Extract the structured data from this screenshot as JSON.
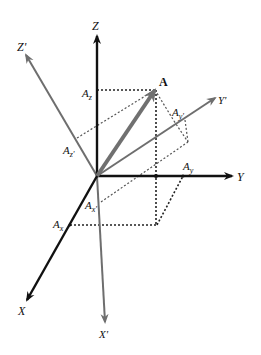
{
  "diagram": {
    "colors": {
      "original_axes": "#111111",
      "rotated_axes": "#6e6e6e",
      "vector": "#707070",
      "dotted": "#222222",
      "background": "#ffffff"
    },
    "origin": [
      97,
      176
    ],
    "axes_original": [
      {
        "name": "Z",
        "label": "Z",
        "tip": [
          97,
          36
        ]
      },
      {
        "name": "Y",
        "label": "Y",
        "tip": [
          232,
          176
        ]
      },
      {
        "name": "X",
        "label": "X",
        "tip": [
          27,
          300
        ]
      }
    ],
    "axes_rotated": [
      {
        "name": "Z'",
        "label": "Z'",
        "tip": [
          26,
          55
        ]
      },
      {
        "name": "Y'",
        "label": "Y'",
        "tip": [
          215,
          98
        ]
      },
      {
        "name": "X'",
        "label": "X'",
        "tip": [
          105,
          322
        ]
      }
    ],
    "vector": {
      "label": "A",
      "tip": [
        155,
        90
      ]
    },
    "components": {
      "Az": {
        "main": "A",
        "sub": "z"
      },
      "Ay": {
        "main": "A",
        "sub": "y"
      },
      "Ax": {
        "main": "A",
        "sub": "x"
      },
      "Azp": {
        "main": "A",
        "sub": "z'"
      },
      "Ayp": {
        "main": "A",
        "sub": "y'"
      },
      "Axp": {
        "main": "A",
        "sub": "x'"
      }
    }
  }
}
